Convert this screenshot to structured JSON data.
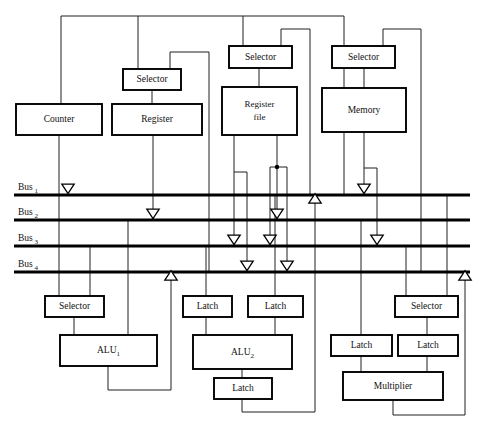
{
  "diagram": {
    "colors": {
      "background": "#ffffff",
      "wire": "#231f20",
      "bus": "#000000",
      "box_stroke": "#000000",
      "box_fill": "#ffffff"
    },
    "buses": [
      {
        "id": "bus1",
        "label": "Bus",
        "subscript": "1",
        "y": 195,
        "x1": 14,
        "x2": 470
      },
      {
        "id": "bus2",
        "label": "Bus",
        "subscript": "2",
        "y": 220,
        "x1": 14,
        "x2": 470
      },
      {
        "id": "bus3",
        "label": "Bus",
        "subscript": "3",
        "y": 246,
        "x1": 14,
        "x2": 470
      },
      {
        "id": "bus4",
        "label": "Bus",
        "subscript": "4",
        "y": 272,
        "x1": 14,
        "x2": 470
      }
    ],
    "units": [
      {
        "id": "counter",
        "label": "Counter",
        "x": 16,
        "y": 104,
        "w": 86,
        "h": 31
      },
      {
        "id": "selector-reg",
        "label": "Selector",
        "x": 123,
        "y": 69,
        "w": 58,
        "h": 21
      },
      {
        "id": "register",
        "label": "Register",
        "x": 112,
        "y": 104,
        "w": 90,
        "h": 31
      },
      {
        "id": "selector-rf",
        "label": "Selector",
        "x": 229,
        "y": 46,
        "w": 63,
        "h": 22
      },
      {
        "id": "register-file",
        "label": "Register file",
        "line1": "Register",
        "line2": "file",
        "x": 222,
        "y": 87,
        "w": 75,
        "h": 48
      },
      {
        "id": "selector-mem",
        "label": "Selector",
        "x": 332,
        "y": 46,
        "w": 63,
        "h": 22
      },
      {
        "id": "memory",
        "label": "Memory",
        "x": 322,
        "y": 88,
        "w": 84,
        "h": 44
      },
      {
        "id": "selector-alu1",
        "label": "Selector",
        "x": 45,
        "y": 296,
        "w": 59,
        "h": 21
      },
      {
        "id": "alu1",
        "label": "ALU",
        "subscript": "1",
        "x": 60,
        "y": 335,
        "w": 97,
        "h": 31
      },
      {
        "id": "latch-alu2-a",
        "label": "Latch",
        "x": 183,
        "y": 296,
        "w": 49,
        "h": 21
      },
      {
        "id": "latch-alu2-b",
        "label": "Latch",
        "x": 248,
        "y": 296,
        "w": 55,
        "h": 21
      },
      {
        "id": "alu2",
        "label": "ALU",
        "subscript": "2",
        "x": 193,
        "y": 335,
        "w": 99,
        "h": 34
      },
      {
        "id": "latch-alu2-out",
        "label": "Latch",
        "x": 214,
        "y": 378,
        "w": 58,
        "h": 21
      },
      {
        "id": "selector-mul",
        "label": "Selector",
        "x": 395,
        "y": 296,
        "w": 63,
        "h": 21
      },
      {
        "id": "latch-mul-a",
        "label": "Latch",
        "x": 331,
        "y": 335,
        "w": 61,
        "h": 21
      },
      {
        "id": "latch-mul-b",
        "label": "Latch",
        "x": 398,
        "y": 335,
        "w": 60,
        "h": 21
      },
      {
        "id": "multiplier",
        "label": "Multiplier",
        "x": 343,
        "y": 372,
        "w": 100,
        "h": 28
      }
    ],
    "arrows": [
      {
        "id": "arrow-counter-bus1",
        "x": 68,
        "y": 195,
        "dir": "down"
      },
      {
        "id": "arrow-register-bus2",
        "x": 153,
        "y": 220,
        "dir": "down"
      },
      {
        "id": "arrow-alu1-bus4",
        "x": 171,
        "y": 272,
        "dir": "up"
      },
      {
        "id": "arrow-rf-a-bus3",
        "x": 234,
        "y": 246,
        "dir": "down"
      },
      {
        "id": "arrow-rf-a-bus4",
        "x": 247,
        "y": 272,
        "dir": "down"
      },
      {
        "id": "arrow-rf-b-bus3",
        "x": 270,
        "y": 246,
        "dir": "down"
      },
      {
        "id": "arrow-rf-b-bus2",
        "x": 277,
        "y": 220,
        "dir": "down"
      },
      {
        "id": "arrow-rf-b-bus4",
        "x": 287,
        "y": 272,
        "dir": "down"
      },
      {
        "id": "arrow-alu2-bus1",
        "x": 315,
        "y": 195,
        "dir": "up"
      },
      {
        "id": "arrow-memory-bus1",
        "x": 364,
        "y": 195,
        "dir": "down"
      },
      {
        "id": "arrow-memory-bus3",
        "x": 377,
        "y": 246,
        "dir": "down"
      },
      {
        "id": "arrow-mul-bus4",
        "x": 465,
        "y": 272,
        "dir": "up"
      }
    ],
    "wires": [
      {
        "id": "top-rail",
        "d": "M 61 16 L 344 16"
      },
      {
        "id": "top-to-counter",
        "d": "M 61 16 L 61 104"
      },
      {
        "id": "top-to-selector-reg",
        "d": "M 138 16 L 138 69"
      },
      {
        "id": "top-to-selector-rf",
        "d": "M 243 16 L 243 46"
      },
      {
        "id": "top-down-right",
        "d": "M 344 16 L 344 195"
      },
      {
        "id": "rf-sel-right-feed",
        "d": "M 281 46 L 281 29 L 310 29 L 310 195"
      },
      {
        "id": "mem-sel-right-feed",
        "d": "M 383 46 L 383 29 L 421 29 L 421 272"
      },
      {
        "id": "reg-sel-right-feed",
        "d": "M 170 69 L 170 52 L 209 52 L 209 272"
      },
      {
        "id": "counter-down",
        "d": "M 59 135 L 59 195"
      },
      {
        "id": "selector-reg-to-reg",
        "d": "M 152 90 L 152 104"
      },
      {
        "id": "register-down",
        "d": "M 153 135 L 153 220"
      },
      {
        "id": "selector-rf-to-rf",
        "d": "M 259 68 L 259 87"
      },
      {
        "id": "rf-out-a",
        "d": "M 234 135 L 234 246"
      },
      {
        "id": "rf-out-a-branch",
        "d": "M 234 172 L 247 172 L 247 272"
      },
      {
        "id": "rf-out-b",
        "d": "M 277 135 L 277 220"
      },
      {
        "id": "rf-out-b-branch-l",
        "d": "M 270 167 L 270 246"
      },
      {
        "id": "rf-out-b-branch-bar",
        "d": "M 270 167 L 287 167"
      },
      {
        "id": "rf-out-b-branch-r",
        "d": "M 287 167 L 287 272"
      },
      {
        "id": "selector-mem-to-mem",
        "d": "M 364 68 L 364 88"
      },
      {
        "id": "memory-out",
        "d": "M 364 132 L 364 195"
      },
      {
        "id": "memory-out-branch",
        "d": "M 364 168 L 377 168 L 377 246"
      },
      {
        "id": "bus1-to-selector-alu1",
        "d": "M 59 195 L 59 296"
      },
      {
        "id": "bus3-to-selector-alu1",
        "d": "M 90 246 L 90 296"
      },
      {
        "id": "selector-alu1-to-alu1",
        "d": "M 74 317 L 74 335"
      },
      {
        "id": "bus2-to-alu1",
        "d": "M 128 220 L 128 335"
      },
      {
        "id": "alu1-out",
        "d": "M 108 366 L 108 390 L 171 390 L 171 272"
      },
      {
        "id": "bus3-to-latch-a",
        "d": "M 206 246 L 206 296"
      },
      {
        "id": "bus1-to-latch-b",
        "d": "M 275 195 L 275 296"
      },
      {
        "id": "latch-a-to-alu2",
        "d": "M 206 317 L 206 335"
      },
      {
        "id": "latch-b-to-alu2",
        "d": "M 275 317 L 275 335"
      },
      {
        "id": "alu2-to-latch",
        "d": "M 242 369 L 242 378"
      },
      {
        "id": "latch-out-to-bus1",
        "d": "M 242 399 L 242 412 L 315 412 L 315 195"
      },
      {
        "id": "bus2-to-latch-mul-a",
        "d": "M 361 220 L 361 335"
      },
      {
        "id": "bus3-to-selector-mul",
        "d": "M 406 246 L 406 296"
      },
      {
        "id": "bus1-to-selector-mul",
        "d": "M 447 195 L 447 296"
      },
      {
        "id": "selector-mul-to-latch",
        "d": "M 427 317 L 427 335"
      },
      {
        "id": "latch-mul-a-to-mul",
        "d": "M 361 356 L 361 372"
      },
      {
        "id": "latch-mul-b-to-mul",
        "d": "M 427 356 L 427 372"
      },
      {
        "id": "multiplier-out",
        "d": "M 393 400 L 393 415 L 465 415 L 465 272"
      }
    ],
    "junctions": [
      {
        "id": "junction-rf-out-b",
        "x": 277,
        "y": 167,
        "r": 2.2
      }
    ]
  }
}
